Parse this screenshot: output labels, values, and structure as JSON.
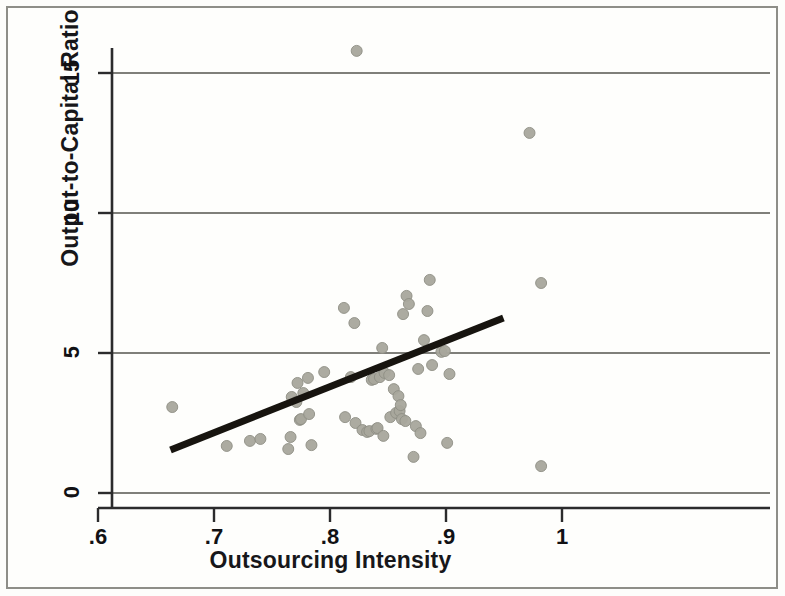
{
  "chart_data": {
    "type": "scatter",
    "title": "",
    "xlabel": "Outsourcing Intensity",
    "ylabel": "Output-to-Capital Ratio",
    "xlim": [
      0.6,
      1.0
    ],
    "ylim": [
      -0.6,
      16.5
    ],
    "xticks": [
      0.6,
      0.7,
      0.8,
      0.9,
      1.0
    ],
    "xticklabels": [
      ".6",
      ".7",
      ".8",
      ".9",
      "1"
    ],
    "yticks": [
      0,
      5,
      10,
      15
    ],
    "yticklabels": [
      "0",
      "5",
      "10",
      "15"
    ],
    "grid": "horizontal",
    "gridlines_at": [
      0,
      5,
      10,
      15
    ],
    "legend": null,
    "marker": {
      "shape": "circle",
      "color": "#a8a79c",
      "edge_color": "#8f8e84",
      "size_px": 11,
      "opacity": 0.95
    },
    "series": [
      {
        "name": "Observations",
        "type": "scatter",
        "points": [
          [
            0.664,
            3.07
          ],
          [
            0.711,
            1.68
          ],
          [
            0.731,
            1.86
          ],
          [
            0.74,
            1.93
          ],
          [
            0.764,
            1.57
          ],
          [
            0.766,
            2.0
          ],
          [
            0.767,
            3.43
          ],
          [
            0.771,
            3.25
          ],
          [
            0.772,
            3.93
          ],
          [
            0.774,
            2.61
          ],
          [
            0.775,
            2.64
          ],
          [
            0.777,
            3.57
          ],
          [
            0.781,
            4.11
          ],
          [
            0.782,
            2.82
          ],
          [
            0.784,
            1.71
          ],
          [
            0.795,
            4.32
          ],
          [
            0.812,
            6.61
          ],
          [
            0.813,
            2.71
          ],
          [
            0.818,
            4.14
          ],
          [
            0.821,
            6.07
          ],
          [
            0.822,
            2.5
          ],
          [
            0.823,
            15.79
          ],
          [
            0.828,
            2.25
          ],
          [
            0.832,
            2.18
          ],
          [
            0.834,
            2.21
          ],
          [
            0.836,
            4.04
          ],
          [
            0.838,
            4.07
          ],
          [
            0.84,
            2.29
          ],
          [
            0.841,
            2.32
          ],
          [
            0.843,
            4.14
          ],
          [
            0.845,
            5.18
          ],
          [
            0.846,
            2.04
          ],
          [
            0.847,
            4.29
          ],
          [
            0.851,
            4.21
          ],
          [
            0.852,
            2.71
          ],
          [
            0.855,
            3.71
          ],
          [
            0.857,
            2.86
          ],
          [
            0.859,
            3.46
          ],
          [
            0.86,
            2.93
          ],
          [
            0.861,
            3.14
          ],
          [
            0.862,
            2.64
          ],
          [
            0.863,
            6.39
          ],
          [
            0.865,
            2.57
          ],
          [
            0.866,
            7.04
          ],
          [
            0.868,
            6.75
          ],
          [
            0.872,
            1.29
          ],
          [
            0.874,
            2.39
          ],
          [
            0.876,
            4.43
          ],
          [
            0.878,
            2.14
          ],
          [
            0.881,
            5.46
          ],
          [
            0.884,
            6.5
          ],
          [
            0.886,
            7.61
          ],
          [
            0.888,
            4.57
          ],
          [
            0.896,
            5.04
          ],
          [
            0.899,
            5.07
          ],
          [
            0.901,
            1.79
          ],
          [
            0.903,
            4.25
          ],
          [
            0.972,
            12.86
          ],
          [
            0.982,
            7.5
          ],
          [
            0.982,
            0.96
          ]
        ]
      },
      {
        "name": "Fitted regression line",
        "type": "line",
        "color": "#17140f",
        "width_px": 7,
        "endpoints": [
          [
            0.6625,
            1.54
          ],
          [
            0.9495,
            6.25
          ]
        ],
        "slope": 16.4,
        "intercept": -9.33
      }
    ]
  },
  "axes": {
    "x_axis_name": "x-axis",
    "y_axis_name": "y-axis"
  }
}
